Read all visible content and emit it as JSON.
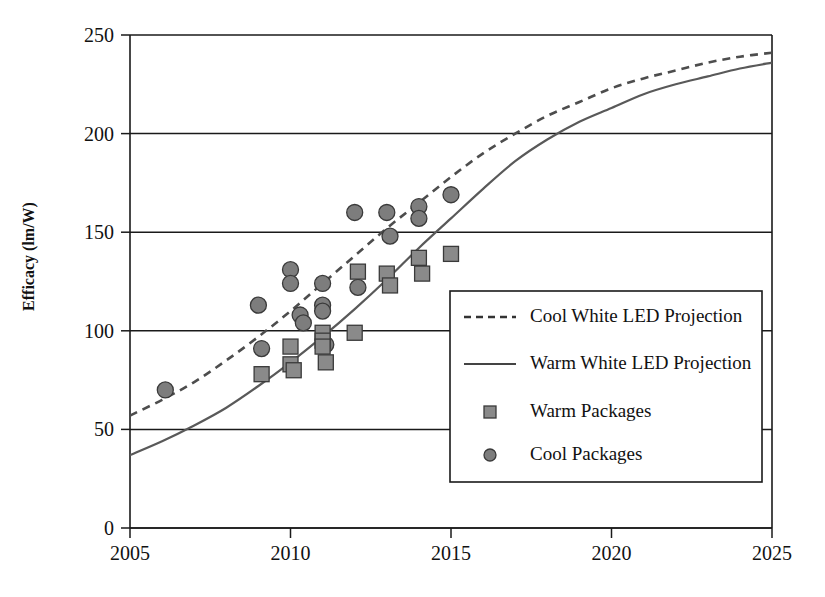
{
  "chart_data": {
    "type": "scatter",
    "title": "",
    "subtitle": "",
    "xlabel": "",
    "ylabel": "Efficacy (lm/W)",
    "xlim": [
      2005,
      2025
    ],
    "ylim": [
      0,
      250
    ],
    "grid": true,
    "x_ticks": [
      2005,
      2010,
      2015,
      2020,
      2025
    ],
    "x_tick_labels": [
      "2005",
      "2010",
      "2015",
      "2020",
      "2025"
    ],
    "y_ticks": [
      0,
      50,
      100,
      150,
      200,
      250
    ],
    "y_tick_labels": [
      "0",
      "50",
      "100",
      "150",
      "200",
      "250"
    ],
    "legend_position": "center-right",
    "legend_entries": [
      {
        "label": "Cool White LED Projection",
        "marker": "dashed-line",
        "color": "#4d4d4d"
      },
      {
        "label": "Warm White LED Projection",
        "marker": "solid-line",
        "color": "#595959"
      },
      {
        "label": "Warm Packages",
        "marker": "square",
        "color": "#8a8a8a"
      },
      {
        "label": "Cool Packages",
        "marker": "circle",
        "color": "#7d7d7d"
      }
    ],
    "series": [
      {
        "name": "Cool White LED Projection",
        "type": "line",
        "style": "dashed",
        "color": "#4d4d4d",
        "points": [
          [
            2005,
            57
          ],
          [
            2006,
            65
          ],
          [
            2007,
            74
          ],
          [
            2008,
            85
          ],
          [
            2009,
            97
          ],
          [
            2010,
            110
          ],
          [
            2011,
            124
          ],
          [
            2012,
            138
          ],
          [
            2013,
            152
          ],
          [
            2014,
            165
          ],
          [
            2015,
            178
          ],
          [
            2016,
            190
          ],
          [
            2017,
            200
          ],
          [
            2018,
            209
          ],
          [
            2019,
            216
          ],
          [
            2020,
            223
          ],
          [
            2021,
            228
          ],
          [
            2022,
            232
          ],
          [
            2023,
            236
          ],
          [
            2024,
            239
          ],
          [
            2025,
            241
          ]
        ]
      },
      {
        "name": "Warm White LED Projection",
        "type": "line",
        "style": "solid",
        "color": "#595959",
        "points": [
          [
            2005,
            37
          ],
          [
            2006,
            44
          ],
          [
            2007,
            52
          ],
          [
            2008,
            61
          ],
          [
            2009,
            72
          ],
          [
            2010,
            84
          ],
          [
            2011,
            97
          ],
          [
            2012,
            111
          ],
          [
            2013,
            126
          ],
          [
            2014,
            142
          ],
          [
            2015,
            157
          ],
          [
            2016,
            172
          ],
          [
            2017,
            186
          ],
          [
            2018,
            197
          ],
          [
            2019,
            206
          ],
          [
            2020,
            213
          ],
          [
            2021,
            220
          ],
          [
            2022,
            225
          ],
          [
            2023,
            229
          ],
          [
            2024,
            233
          ],
          [
            2025,
            236
          ]
        ]
      },
      {
        "name": "Cool Packages",
        "type": "scatter",
        "marker": "circle",
        "color": "#7d7d7d",
        "points": [
          [
            2006.1,
            70
          ],
          [
            2009.0,
            113
          ],
          [
            2009.1,
            91
          ],
          [
            2010.0,
            131
          ],
          [
            2010.0,
            124
          ],
          [
            2010.3,
            108
          ],
          [
            2010.4,
            104
          ],
          [
            2011.0,
            124
          ],
          [
            2011.0,
            113
          ],
          [
            2011.0,
            110
          ],
          [
            2011.1,
            93
          ],
          [
            2012.0,
            160
          ],
          [
            2012.1,
            122
          ],
          [
            2013.0,
            160
          ],
          [
            2013.1,
            148
          ],
          [
            2014.0,
            163
          ],
          [
            2014.0,
            157
          ],
          [
            2015.0,
            169
          ]
        ]
      },
      {
        "name": "Warm Packages",
        "type": "scatter",
        "marker": "square",
        "color": "#8a8a8a",
        "points": [
          [
            2009.1,
            78
          ],
          [
            2010.0,
            92
          ],
          [
            2010.0,
            83
          ],
          [
            2010.1,
            80
          ],
          [
            2011.0,
            99
          ],
          [
            2011.0,
            95
          ],
          [
            2011.0,
            92
          ],
          [
            2011.1,
            84
          ],
          [
            2012.0,
            99
          ],
          [
            2012.1,
            130
          ],
          [
            2013.0,
            129
          ],
          [
            2013.1,
            123
          ],
          [
            2014.0,
            137
          ],
          [
            2014.1,
            129
          ],
          [
            2015.0,
            139
          ]
        ]
      }
    ]
  }
}
